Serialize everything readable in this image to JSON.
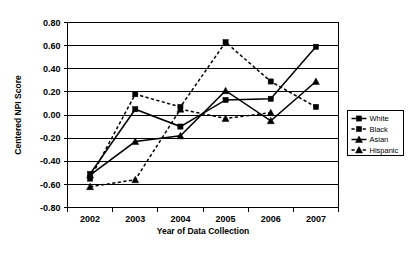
{
  "chart_data": {
    "type": "line",
    "title": "",
    "xlabel": "Year of Data Collection",
    "ylabel": "Centered NPI Score",
    "categories": [
      "2002",
      "2003",
      "2004",
      "2005",
      "2006",
      "2007"
    ],
    "x": [
      2002,
      2003,
      2004,
      2005,
      2006,
      2007
    ],
    "ylim": [
      -0.8,
      0.8
    ],
    "ytick_values": [
      0.8,
      0.6,
      0.4,
      0.2,
      0.0,
      -0.2,
      -0.4,
      -0.6,
      -0.8
    ],
    "ytick_labels": [
      "0.80",
      "0.60",
      "0.40",
      "0.20",
      "0.00",
      "-0.20",
      "-0.40",
      "-0.60",
      "-0.80"
    ],
    "grid": "horizontal",
    "legend_position": "right",
    "series": [
      {
        "name": "White",
        "style": "solid",
        "marker": "square",
        "values": [
          -0.51,
          0.05,
          -0.1,
          0.13,
          0.14,
          0.59
        ]
      },
      {
        "name": "Black",
        "style": "dashed",
        "marker": "square",
        "values": [
          -0.55,
          0.18,
          0.07,
          0.63,
          0.29,
          0.07
        ]
      },
      {
        "name": "Asian",
        "style": "solid",
        "marker": "triangle",
        "values": [
          -0.52,
          -0.23,
          -0.18,
          0.21,
          -0.05,
          0.29
        ]
      },
      {
        "name": "Hispanic",
        "style": "dashed",
        "marker": "triangle",
        "values": [
          -0.62,
          -0.56,
          0.05,
          -0.03,
          0.02,
          null
        ]
      }
    ]
  },
  "legend": {
    "items": [
      {
        "label": "White"
      },
      {
        "label": "Black"
      },
      {
        "label": "Asian"
      },
      {
        "label": "Hispanic"
      }
    ]
  },
  "colors": {
    "line": "#000000",
    "grid": "#000000",
    "background": "#ffffff"
  }
}
